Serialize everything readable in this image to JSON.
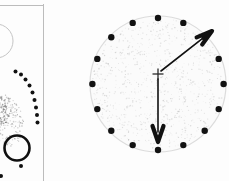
{
  "figure": {
    "background_color": "#fdfdfd",
    "ink_color": "#151515",
    "faint_line_color": "#b9b9b9",
    "stipple_color": "#8d8d8d",
    "width": 229,
    "height": 181
  },
  "frame": {
    "name": "panel-divider",
    "horizontal_rule": {
      "x1": 0,
      "y1": 5.5,
      "x2": 44,
      "y2": 5.5,
      "stroke": "#bcbcbc",
      "width": 1
    },
    "vertical_rule": {
      "x1": 43.5,
      "y1": 4,
      "x2": 43.5,
      "y2": 181,
      "stroke": "#bcbcbc",
      "width": 1
    }
  },
  "left_panel": {
    "name": "left-partial-plan",
    "clipped_arc": {
      "label": "upper-left-faint-arc",
      "cx": -4,
      "cy": 41,
      "r": 17,
      "stroke": "#c5c5c5",
      "width": 1
    },
    "stipple_blob": {
      "label": "lower-left-stippled-mound",
      "cx": 4,
      "cy": 120,
      "rx": 19,
      "ry": 27,
      "rotation": -18,
      "density": 230
    },
    "stipple_blob_inner": {
      "label": "inner-dense-core",
      "cx": 0,
      "cy": 112,
      "rx": 10,
      "ry": 15,
      "density": 120
    },
    "bold_ring": {
      "label": "bold-open-circle",
      "cx": 17,
      "cy": 148,
      "r": 12.5,
      "stroke": "#101010",
      "width": 2.6
    },
    "dot_arc": {
      "label": "curved-dot-arc",
      "dot_radius": 2.0,
      "fill": "#111111",
      "points": [
        [
          15.5,
          71.5
        ],
        [
          21.0,
          74.5
        ],
        [
          25.5,
          79.5
        ],
        [
          29.5,
          85.5
        ],
        [
          32.5,
          92.5
        ],
        [
          34.5,
          100.0
        ],
        [
          36.0,
          107.5
        ],
        [
          37.0,
          115.0
        ],
        [
          37.5,
          122.5
        ]
      ]
    },
    "stray_dots": {
      "label": "stray-dots",
      "dot_radius": 2.0,
      "fill": "#111111",
      "points": [
        [
          21.0,
          166.0
        ],
        [
          1.0,
          176.0
        ]
      ]
    }
  },
  "right_panel": {
    "name": "main-circular-plan",
    "disc": {
      "label": "stippled-disc",
      "cx": 158,
      "cy": 84,
      "r": 68,
      "fill": "#fbfbfb",
      "stroke": "#dcdcdc",
      "stroke_width": 1.2,
      "stipple_density": 900,
      "stipple_color": "#9b9b9b"
    },
    "perimeter_dots": {
      "label": "perimeter-dot-ring",
      "count": 16,
      "dot_radius": 3.2,
      "fill": "#121212",
      "ring_radius": 66,
      "start_angle_deg": -90,
      "points": [
        [
          158.0,
          18.0
        ],
        [
          183.3,
          22.9
        ],
        [
          204.7,
          37.3
        ],
        [
          218.7,
          58.9
        ],
        [
          223.6,
          84.0
        ],
        [
          218.7,
          109.1
        ],
        [
          204.7,
          130.7
        ],
        [
          183.3,
          145.1
        ],
        [
          158.0,
          150.0
        ],
        [
          132.7,
          145.1
        ],
        [
          111.3,
          130.7
        ],
        [
          97.3,
          109.1
        ],
        [
          92.4,
          84.0
        ],
        [
          97.3,
          58.9
        ],
        [
          111.3,
          37.3
        ],
        [
          132.7,
          22.9
        ]
      ]
    },
    "center_mark": {
      "label": "center-cross",
      "cx": 158,
      "cy": 74,
      "arm": 5.5,
      "stroke": "#2a2a2a",
      "width": 1.3
    },
    "arrows": [
      {
        "label": "arrow-northeast",
        "name": "direction-arrow-ne",
        "x1": 161.0,
        "y1": 71.0,
        "x2": 212.0,
        "y2": 31.0,
        "stroke": "#111111",
        "width": 1.6,
        "head_length": 16,
        "head_width": 9,
        "bearing_deg": 52
      },
      {
        "label": "arrow-south",
        "name": "direction-arrow-s",
        "x1": 158.0,
        "y1": 79.0,
        "x2": 158.0,
        "y2": 142.0,
        "stroke": "#111111",
        "width": 1.6,
        "head_length": 16,
        "head_width": 11,
        "bearing_deg": 180
      }
    ]
  }
}
